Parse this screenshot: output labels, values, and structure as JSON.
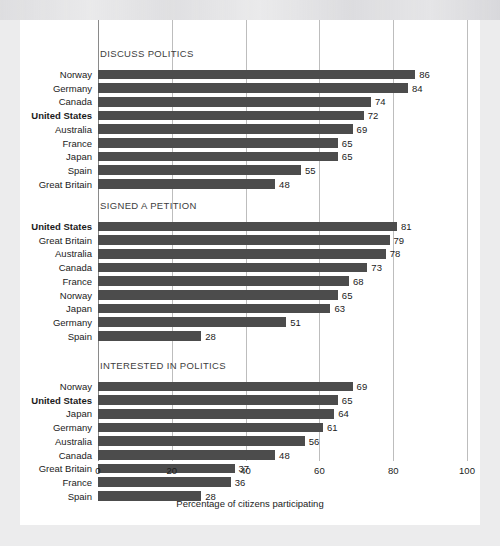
{
  "chart_data": {
    "type": "bar",
    "orientation": "horizontal",
    "title": "",
    "xlabel": "Percentage of citizens participating",
    "ylabel": "",
    "xlim": [
      0,
      100
    ],
    "xticks": [
      0,
      20,
      40,
      60,
      80,
      100
    ],
    "xtick_labels": [
      "0",
      "20",
      "40",
      "60",
      "80",
      "100"
    ],
    "grid": true,
    "legend": "none",
    "highlight_category": "United States",
    "bar_color": "#4c4c4c",
    "panels": [
      {
        "title": "DISCUSS POLITICS",
        "categories": [
          "Norway",
          "Germany",
          "Canada",
          "United States",
          "Australia",
          "France",
          "Japan",
          "Spain",
          "Great Britain"
        ],
        "values": [
          86,
          84,
          74,
          72,
          69,
          65,
          65,
          55,
          48
        ]
      },
      {
        "title": "SIGNED A PETITION",
        "categories": [
          "United States",
          "Great Britain",
          "Australia",
          "Canada",
          "France",
          "Norway",
          "Japan",
          "Germany",
          "Spain"
        ],
        "values": [
          81,
          79,
          78,
          73,
          68,
          65,
          63,
          51,
          28
        ]
      },
      {
        "title": "INTERESTED IN POLITICS",
        "categories": [
          "Norway",
          "United States",
          "Japan",
          "Germany",
          "Australia",
          "Canada",
          "Great Britain",
          "France",
          "Spain"
        ],
        "values": [
          69,
          65,
          64,
          61,
          56,
          48,
          37,
          36,
          28
        ]
      }
    ]
  }
}
